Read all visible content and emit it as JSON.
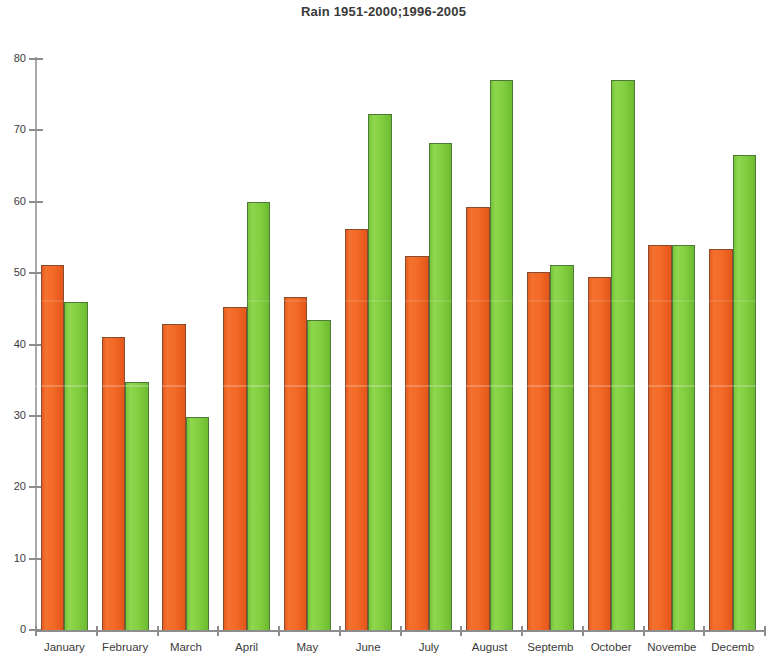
{
  "chart_data": {
    "type": "bar",
    "title": "Rain 1951-2000;1996-2005",
    "xlabel": "",
    "ylabel": "",
    "ylim": [
      0,
      80
    ],
    "yticks": [
      0,
      10,
      20,
      30,
      40,
      50,
      60,
      70,
      80
    ],
    "grid": false,
    "legend": "none",
    "categories": [
      "January",
      "February",
      "March",
      "April",
      "May",
      "June",
      "July",
      "August",
      "Septemb",
      "October",
      "Novembe",
      "Decemb"
    ],
    "series": [
      {
        "name": "1951-2000",
        "color": "#F26A26",
        "values": [
          51.2,
          41.0,
          42.9,
          45.3,
          46.7,
          56.2,
          52.4,
          59.3,
          50.1,
          49.4,
          54.0,
          53.4
        ]
      },
      {
        "name": "1996-2005",
        "color": "#81CD3F",
        "values": [
          46.0,
          34.8,
          29.8,
          60.0,
          43.4,
          72.3,
          68.2,
          77.0,
          51.1,
          77.0,
          54.0,
          66.5
        ]
      }
    ]
  }
}
